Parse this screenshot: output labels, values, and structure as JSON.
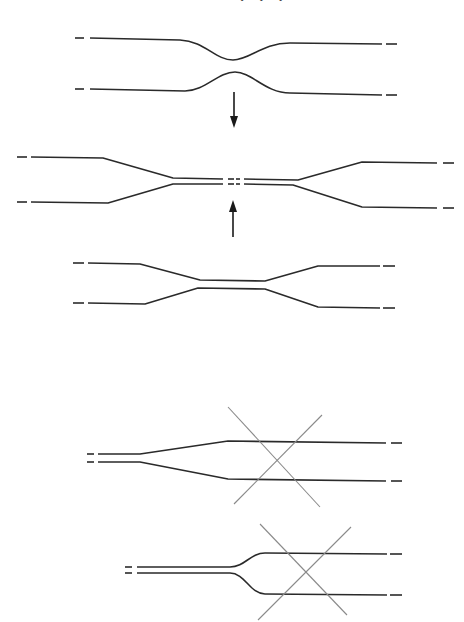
{
  "page": {
    "header_fragment": "• • •"
  },
  "figures": [
    {
      "id": "fig-a",
      "label": "two curved guides approaching (bent waist)",
      "arrow": "down"
    },
    {
      "id": "fig-b",
      "label": "long linear-taper coupler with central break",
      "arrow": "up"
    },
    {
      "id": "fig-c",
      "label": "short linear-taper coupler",
      "arrow": null
    },
    {
      "id": "fig-d",
      "label": "gradual linear Y-branch (crossed out)",
      "crossed": true
    },
    {
      "id": "fig-e",
      "label": "abrupt curved Y-branch (crossed out)",
      "crossed": true
    }
  ],
  "colors": {
    "stroke": "#2a2a2a",
    "cross": "#8a8a8a",
    "background": "#ffffff"
  }
}
